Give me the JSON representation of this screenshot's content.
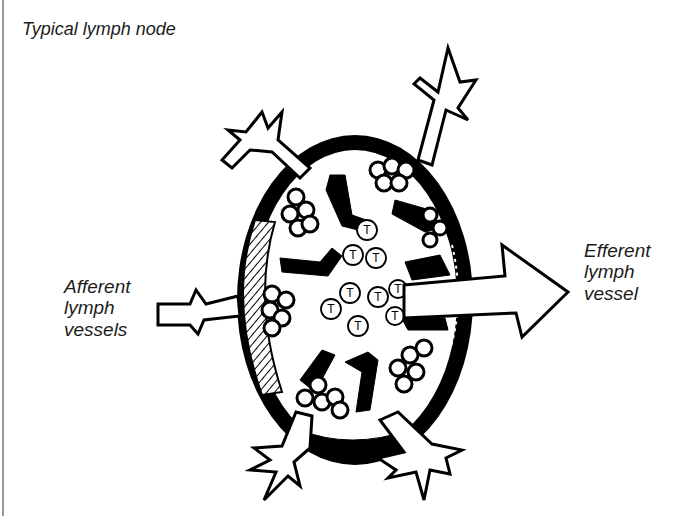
{
  "figure": {
    "title": "Typical lymph node",
    "labels": {
      "afferent": [
        "Afferent",
        "lymph",
        "vessels"
      ],
      "efferent": [
        "Efferent",
        "lymph",
        "vessel"
      ]
    },
    "cell_marker": "T",
    "colors": {
      "ink": "#000000",
      "paper": "#ffffff",
      "text": "#1c1c1c",
      "frame": "#9a9a9a"
    }
  }
}
